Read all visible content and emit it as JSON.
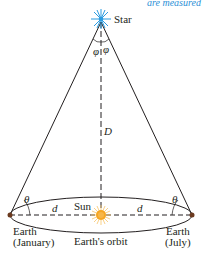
{
  "header": {
    "cutoff_caption": "are measured"
  },
  "diagram": {
    "star_label": "Star",
    "sun_label": "Sun",
    "distance_label": "D",
    "half_baseline_label": "d",
    "parallax_angle_label": "φ",
    "base_angle_label": "θ",
    "orbit_label": "Earth's orbit",
    "earth_left": {
      "line1": "Earth",
      "line2": "(January)"
    },
    "earth_right": {
      "line1": "Earth",
      "line2": "(July)"
    },
    "colors": {
      "star": "#2b9be0",
      "sun": "#f5a623",
      "lines": "#231f20",
      "caption": "#2b8fd6"
    }
  }
}
